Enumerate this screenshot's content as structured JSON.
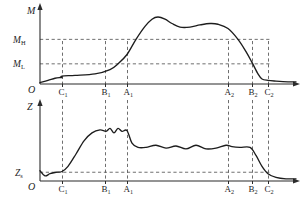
{
  "figure": {
    "title": "",
    "charts": [
      {
        "id": "upper",
        "axis_y_label": "M",
        "axis_origin_label": "O",
        "y_ticks": [
          {
            "base": "M",
            "sub": "H",
            "value": 0.62
          },
          {
            "base": "M",
            "sub": "L",
            "value": 0.28
          }
        ],
        "x_markers": [
          {
            "base": "C",
            "sub": "1",
            "x": 62
          },
          {
            "base": "B",
            "sub": "1",
            "x": 105
          },
          {
            "base": "A",
            "sub": "1",
            "x": 127
          },
          {
            "base": "A",
            "sub": "2",
            "x": 228
          },
          {
            "base": "B",
            "sub": "2",
            "x": 252
          },
          {
            "base": "C",
            "sub": "2",
            "x": 268
          }
        ]
      },
      {
        "id": "lower",
        "axis_y_label": "Z",
        "axis_origin_label": "O",
        "y_ticks": [
          {
            "base": "Z",
            "sub": "s",
            "value": 0.12
          }
        ],
        "x_markers": [
          {
            "base": "C",
            "sub": "1",
            "x": 62
          },
          {
            "base": "B",
            "sub": "1",
            "x": 105
          },
          {
            "base": "A",
            "sub": "1",
            "x": 127
          },
          {
            "base": "A",
            "sub": "2",
            "x": 228
          },
          {
            "base": "B",
            "sub": "2",
            "x": 252
          },
          {
            "base": "C",
            "sub": "2",
            "x": 268
          }
        ]
      }
    ]
  },
  "chart_data": [
    {
      "type": "line",
      "id": "torque-profile",
      "title": "",
      "xlabel": "",
      "ylabel": "M",
      "ylim": [
        0,
        1
      ],
      "grid": false,
      "legend": null,
      "axis_arrows": true,
      "threshold_lines": [
        {
          "label": "M_H",
          "value": 0.62
        },
        {
          "label": "M_L",
          "value": 0.28
        }
      ],
      "event_markers": [
        "C1",
        "B1",
        "A1",
        "A2",
        "B2",
        "C2"
      ],
      "series": [
        {
          "name": "M",
          "x": [
            40,
            48,
            55,
            60,
            62,
            62,
            75,
            95,
            110,
            118,
            127,
            136,
            145,
            152,
            158,
            165,
            172,
            180,
            190,
            200,
            210,
            218,
            228,
            238,
            246,
            252,
            258,
            262,
            268,
            276,
            288,
            296
          ],
          "values": [
            0.02,
            0.05,
            0.08,
            0.09,
            0.09,
            0.11,
            0.12,
            0.14,
            0.2,
            0.28,
            0.41,
            0.62,
            0.8,
            0.9,
            0.93,
            0.9,
            0.84,
            0.79,
            0.79,
            0.82,
            0.84,
            0.83,
            0.77,
            0.62,
            0.45,
            0.3,
            0.14,
            0.07,
            0.05,
            0.04,
            0.03,
            0.03
          ]
        }
      ]
    },
    {
      "type": "line",
      "id": "depth-profile",
      "title": "",
      "xlabel": "",
      "ylabel": "Z",
      "ylim": [
        0,
        1
      ],
      "grid": false,
      "legend": null,
      "axis_arrows": true,
      "threshold_lines": [
        {
          "label": "Z_s",
          "value": 0.12
        }
      ],
      "event_markers": [
        "C1",
        "B1",
        "A1",
        "A2",
        "B2",
        "C2"
      ],
      "series": [
        {
          "name": "Z",
          "x": [
            40,
            45,
            50,
            56,
            62,
            68,
            76,
            84,
            92,
            100,
            106,
            110,
            114,
            118,
            122,
            127,
            132,
            138,
            146,
            156,
            166,
            176,
            186,
            196,
            206,
            216,
            226,
            232,
            240,
            250,
            256,
            262,
            268,
            276,
            286,
            296
          ],
          "values": [
            0.14,
            0.07,
            0.1,
            0.12,
            0.13,
            0.2,
            0.37,
            0.55,
            0.66,
            0.7,
            0.68,
            0.72,
            0.66,
            0.72,
            0.68,
            0.69,
            0.52,
            0.46,
            0.46,
            0.49,
            0.45,
            0.48,
            0.44,
            0.49,
            0.44,
            0.45,
            0.49,
            0.47,
            0.46,
            0.46,
            0.35,
            0.2,
            0.1,
            0.05,
            0.03,
            0.03
          ]
        }
      ]
    }
  ]
}
